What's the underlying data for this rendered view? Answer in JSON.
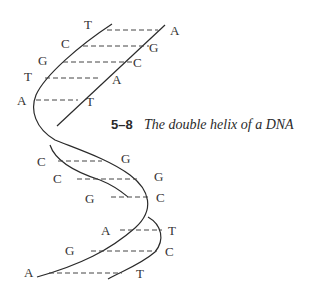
{
  "caption": {
    "number": "5–8",
    "title": "The double helix of a DNA"
  },
  "bases": {
    "top_left": [
      "T",
      "C",
      "G",
      "T",
      "A"
    ],
    "top_right": [
      "A",
      "G",
      "C",
      "A",
      "T"
    ],
    "middle_left": [
      "C",
      "C",
      "G"
    ],
    "middle_right": [
      "G",
      "G",
      "C"
    ],
    "bottom_left": [
      "A",
      "G",
      "A"
    ],
    "bottom_right": [
      "T",
      "C",
      "T"
    ]
  },
  "colors": {
    "strand": "#2a2a2a",
    "bond": "#444444",
    "text": "#333333"
  }
}
